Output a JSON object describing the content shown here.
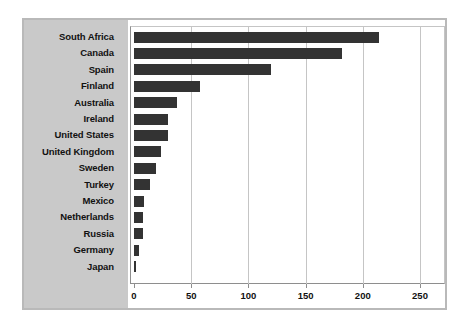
{
  "chart_data": {
    "type": "bar",
    "orientation": "horizontal",
    "title": "",
    "subtitle": "",
    "xlabel": "",
    "ylabel": "",
    "xlim": [
      0,
      250
    ],
    "ylim": null,
    "grid": true,
    "legend": null,
    "legend_position": "none",
    "xticks": [
      "0",
      "50",
      "100",
      "150",
      "200",
      "250"
    ],
    "xtick_values": [
      0,
      50,
      100,
      150,
      200,
      250
    ],
    "categories": [
      "South Africa",
      "Canada",
      "Spain",
      "Finland",
      "Australia",
      "Ireland",
      "United States",
      "United Kingdom",
      "Sweden",
      "Turkey",
      "Mexico",
      "Netherlands",
      "Russia",
      "Germany",
      "Japan"
    ],
    "values": [
      214,
      182,
      120,
      58,
      38,
      30,
      30,
      24,
      19,
      14,
      9,
      8,
      8,
      4,
      2
    ],
    "colors": {
      "bar": "#333333",
      "panel": "#c9c9c9",
      "plot_background": "#ffffff",
      "frame_border": "#b9b9b9",
      "axis_line": "#8e8e8e",
      "gridline": "#c5c5c5",
      "text": "#111111"
    }
  }
}
